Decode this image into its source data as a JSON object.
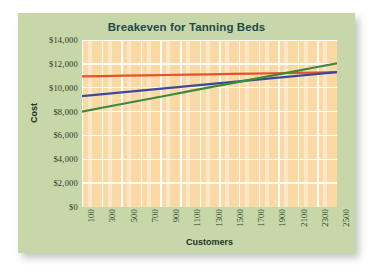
{
  "card": {
    "background_color": "#c7d7a9"
  },
  "chart_data": {
    "type": "line",
    "title": "Breakeven for Tanning Beds",
    "xlabel": "Customers",
    "ylabel": "Cost",
    "grid": true,
    "legend": "none",
    "plot_background_color": "#fbd9a5",
    "gridline_color": "#ffffff",
    "x": [
      100,
      300,
      500,
      700,
      900,
      1100,
      1300,
      1500,
      1700,
      1900,
      2100,
      2300,
      2500
    ],
    "xtick_labels": [
      "100",
      "300",
      "500",
      "700",
      "900",
      "1100",
      "1300",
      "1500",
      "1700",
      "1900",
      "2100",
      "2300",
      "2500"
    ],
    "xlim": [
      100,
      2500
    ],
    "ytick_values": [
      0,
      2000,
      4000,
      6000,
      8000,
      10000,
      12000,
      14000
    ],
    "ytick_labels": [
      "$0",
      "$2,000",
      "$4,000",
      "$6,000",
      "$8,000",
      "$10,000",
      "$12,000",
      "$14,000"
    ],
    "ylim": [
      0,
      14000
    ],
    "series": [
      {
        "name": "red-line",
        "color": "#e8502a",
        "values": [
          10950,
          10979,
          11008,
          11038,
          11067,
          11096,
          11125,
          11154,
          11183,
          11213,
          11242,
          11271,
          11300
        ]
      },
      {
        "name": "blue-line",
        "color": "#3b4a9c",
        "values": [
          9300,
          9467,
          9633,
          9800,
          9967,
          10133,
          10300,
          10467,
          10633,
          10800,
          10967,
          11133,
          11300
        ]
      },
      {
        "name": "green-line",
        "color": "#3d8a3d",
        "values": [
          8000,
          8338,
          8675,
          9013,
          9350,
          9688,
          10025,
          10363,
          10700,
          11038,
          11375,
          11713,
          12050
        ]
      }
    ]
  }
}
